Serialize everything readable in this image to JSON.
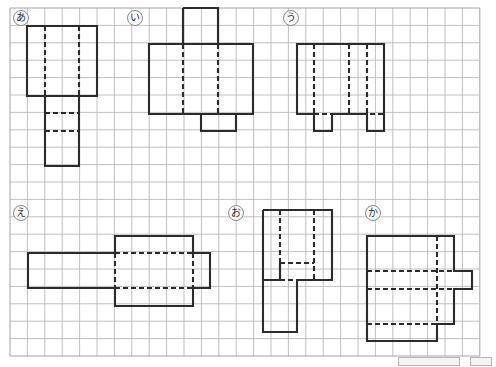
{
  "page": {
    "background_color": "#ffffff",
    "grid": {
      "origin_x": 10,
      "origin_y": 8,
      "cell": 17.4,
      "cols": 27,
      "rows": 20,
      "line_color_minor": "#b9b9b9",
      "line_color_major": "#9a9a9a",
      "border_color": "#9a9a9a",
      "major_every": 1
    },
    "stroke": {
      "solid_color": "#2b2b2b",
      "dash_color": "#2b2b2b",
      "solid_width": 2.1,
      "dash_width": 2.1,
      "dash_pattern": "5,3"
    }
  },
  "labels": [
    {
      "id": "a",
      "text": "あ",
      "x": 13,
      "y": 10
    },
    {
      "id": "i",
      "text": "い",
      "x": 127,
      "y": 10
    },
    {
      "id": "u",
      "text": "う",
      "x": 283,
      "y": 10
    },
    {
      "id": "e",
      "text": "え",
      "x": 13,
      "y": 205
    },
    {
      "id": "o",
      "text": "お",
      "x": 228,
      "y": 205
    },
    {
      "id": "ka",
      "text": "か",
      "x": 365,
      "y": 205
    }
  ],
  "figures": [
    {
      "name": "figure-a",
      "label": "あ",
      "solid_paths": [
        "M 27,26 L 97,26 L 97,96 L 27,96 Z",
        "M 45,96 L 79,96 L 79,166 L 45,166 Z"
      ],
      "dashed_paths": [
        "M 45,26 L 45,96",
        "M 79,26 L 79,96",
        "M 45,96 L 79,96",
        "M 45,113 L 79,113",
        "M 45,131 L 79,131"
      ]
    },
    {
      "name": "figure-i",
      "label": "い",
      "solid_paths": [
        "M 149,44 L 253,44 L 253,114 L 149,114 Z",
        "M 183,8 L 218,8 L 218,44",
        "M 183,8 L 183,44",
        "M 201,114 L 201,131 L 236,131 L 236,114"
      ],
      "dashed_paths": [
        "M 183,44 L 218,44",
        "M 183,44 L 183,114",
        "M 218,44 L 218,114",
        "M 201,114 L 253,114"
      ]
    },
    {
      "name": "figure-u",
      "label": "う",
      "solid_paths": [
        "M 297,44 L 384,44 L 384,131 L 367,131 L 367,114 L 332,114 L 332,131 L 314,131 L 314,114 L 297,114 Z"
      ],
      "dashed_paths": [
        "M 314,44 L 314,114",
        "M 349,44 L 349,114",
        "M 367,44 L 367,114",
        "M 314,114 L 384,114"
      ]
    },
    {
      "name": "figure-e",
      "label": "え",
      "solid_paths": [
        "M 28,253 L 115,253 L 115,236 L 193,236 L 193,253 L 210,253 L 210,288 L 193,288 L 193,306 L 115,306 L 115,288 L 28,288 Z"
      ],
      "dashed_paths": [
        "M 115,253 L 115,288",
        "M 193,253 L 193,288",
        "M 115,253 L 193,253",
        "M 115,288 L 193,288"
      ]
    },
    {
      "name": "figure-o",
      "label": "お",
      "solid_paths": [
        "M 263,210 L 332,210 L 332,280 L 297,280 L 297,332 L 263,332 L 263,280 L 280,280 L 280,263",
        "M 263,210 L 263,280"
      ],
      "dashed_paths": [
        "M 280,210 L 280,280",
        "M 314,210 L 314,280",
        "M 280,280 L 314,280",
        "M 280,263 L 314,263"
      ]
    },
    {
      "name": "figure-ka",
      "label": "か",
      "solid_paths": [
        "M 367,236 L 454,236 L 454,271 L 472,271 L 472,289 L 454,289 L 454,324 L 437,324 L 437,341 L 367,341 Z"
      ],
      "dashed_paths": [
        "M 367,271 L 454,271",
        "M 367,289 L 454,289",
        "M 367,324 L 454,324",
        "M 437,236 L 437,324"
      ]
    }
  ],
  "footer": {
    "bars": [
      {
        "x": 398,
        "y": 357,
        "width": 60,
        "height": 7
      },
      {
        "x": 470,
        "y": 357,
        "width": 20,
        "height": 7
      }
    ]
  }
}
